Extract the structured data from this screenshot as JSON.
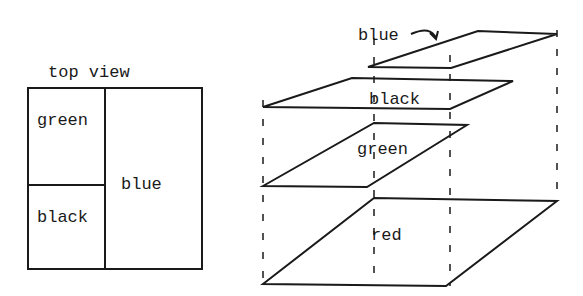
{
  "top_view": {
    "title": "top view",
    "regions": [
      {
        "name": "green",
        "label": "green"
      },
      {
        "name": "black",
        "label": "black"
      },
      {
        "name": "blue",
        "label": "blue"
      }
    ]
  },
  "exploded_view": {
    "layers": [
      {
        "name": "blue",
        "label": "blue",
        "annotation": "arrow pointing to layer"
      },
      {
        "name": "black",
        "label": "black"
      },
      {
        "name": "green",
        "label": "green"
      },
      {
        "name": "red",
        "label": "red"
      }
    ]
  },
  "colors": {
    "line": "#1a1a1a",
    "background": "#ffffff"
  }
}
